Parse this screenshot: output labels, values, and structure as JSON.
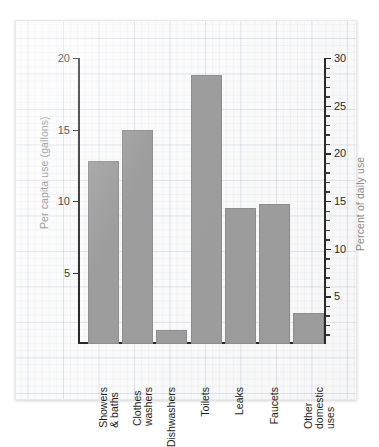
{
  "chart_data": {
    "type": "bar",
    "title": "",
    "subtitle": "",
    "categories": [
      "Showers\n& baths",
      "Clothes\nwashers",
      "Dishwashers",
      "Toilets",
      "Leaks",
      "Faucets",
      "Other\ndomestic\nuses"
    ],
    "values": [
      12.8,
      15.0,
      1.0,
      18.8,
      9.5,
      9.8,
      2.2
    ],
    "xlabel": "",
    "ylabel": "Per capita use (gallons)",
    "ylabel_right": "Percent of daily use",
    "ylim": [
      0,
      20
    ],
    "ylim_right": [
      0,
      30
    ],
    "yticks": [
      5,
      10,
      15,
      20
    ],
    "ytick_labels": [
      "5",
      "10",
      "15",
      "20"
    ],
    "yticks_right": [
      5,
      10,
      15,
      20,
      25,
      30
    ],
    "ytick_labels_right": [
      "5",
      "10",
      "15",
      "20",
      "25",
      "30"
    ],
    "yticks_right_minor_step": 1,
    "grid": true,
    "legend": null,
    "bar_color": "#9d9d9d",
    "bar_edge_color": "#8e8e8e",
    "axis_color": "#2a2a2a",
    "axis_title_color": "#8a8a8a",
    "grid_color": "#c2cede",
    "paper_color": "#fbfbfb"
  }
}
